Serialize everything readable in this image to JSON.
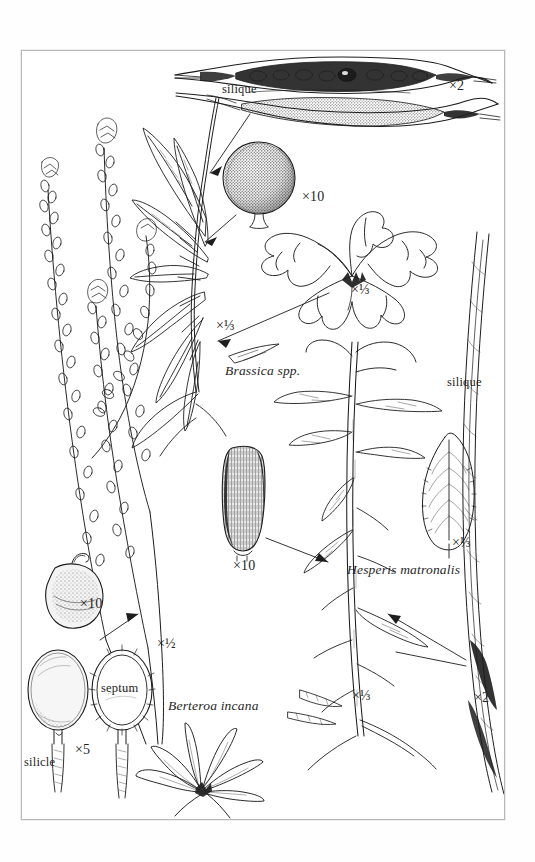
{
  "plate": {
    "kind": "botanical-illustration-plate",
    "background_color": "#ffffff",
    "frame_color": "#b9b9b9",
    "ink_color": "#1d1d1d"
  },
  "species": [
    {
      "id": "brassica",
      "name": "Brassica spp."
    },
    {
      "id": "hesperis",
      "name": "Hesperis matronalis"
    },
    {
      "id": "berteroa",
      "name": "Berteroa incana"
    }
  ],
  "terms": [
    {
      "id": "silique-top",
      "label": "silique"
    },
    {
      "id": "silique-right",
      "label": "silique"
    },
    {
      "id": "septum",
      "label": "septum"
    },
    {
      "id": "silicle",
      "label": "silicle"
    }
  ],
  "magnifications": [
    {
      "id": "mag-silique-top",
      "label": "×2"
    },
    {
      "id": "mag-seed-brassica",
      "label": "×10"
    },
    {
      "id": "mag-rosette-brassica",
      "label": "×⅓"
    },
    {
      "id": "mag-pod-brassica",
      "label": "×⅓"
    },
    {
      "id": "mag-seed-hesperis",
      "label": "×10"
    },
    {
      "id": "mag-leaf-hesperis",
      "label": "×⅓"
    },
    {
      "id": "mag-plant-hesperis",
      "label": "×⅓"
    },
    {
      "id": "mag-silique-hesperis",
      "label": "×2"
    },
    {
      "id": "mag-seed-berteroa",
      "label": "×10"
    },
    {
      "id": "mag-plant-berteroa",
      "label": "×½"
    },
    {
      "id": "mag-silicle-berteroa",
      "label": "×5"
    }
  ],
  "figures": [
    {
      "id": "silique-pair",
      "description": "two opened siliques with seeds, top of plate"
    },
    {
      "id": "brassica-seed",
      "description": "round stippled Brassica seed"
    },
    {
      "id": "brassica-rosette",
      "description": "lobed basal rosette of Brassica"
    },
    {
      "id": "brassica-shoot",
      "description": "branching shoot with elongate siliques"
    },
    {
      "id": "hesperis-seed",
      "description": "oblong ridged Hesperis seed"
    },
    {
      "id": "hesperis-plant",
      "description": "tall leafy stem of Hesperis matronalis"
    },
    {
      "id": "hesperis-leaf",
      "description": "toothed lanceolate leaf"
    },
    {
      "id": "hesperis-silique",
      "description": "long slender silique at right margin"
    },
    {
      "id": "berteroa-stems",
      "description": "slender racemes of Berteroa incana"
    },
    {
      "id": "berteroa-seed",
      "description": "flattened ovate Berteroa seed"
    },
    {
      "id": "berteroa-silicle-1",
      "description": "intact elliptic silicle"
    },
    {
      "id": "berteroa-silicle-2",
      "description": "silicle opened showing septum"
    },
    {
      "id": "berteroa-rosette",
      "description": "narrow-leaved basal rosette"
    }
  ]
}
